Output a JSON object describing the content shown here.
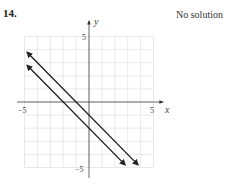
{
  "problem": {
    "number": "14.",
    "answer": "No solution"
  },
  "chart_data": {
    "type": "line",
    "title": "",
    "xlabel": "x",
    "ylabel": "y",
    "xlim": [
      -5,
      5
    ],
    "ylim": [
      -5,
      5
    ],
    "grid": true,
    "x_tick_labels": [
      "-5",
      "5"
    ],
    "y_tick_labels": [
      "5",
      "-5"
    ],
    "series": [
      {
        "name": "line 1",
        "equation": "y = -x - 1",
        "slope": -1,
        "intercept": -1,
        "arrows": "both"
      },
      {
        "name": "line 2",
        "equation": "y = -x - 2",
        "slope": -1,
        "intercept": -2,
        "arrows": "both"
      }
    ],
    "annotation": "No solution"
  },
  "labels": {
    "x_min": "−5",
    "x_max": "5",
    "y_max": "5",
    "y_min": "−5",
    "x_axis": "x",
    "y_axis": "y"
  }
}
